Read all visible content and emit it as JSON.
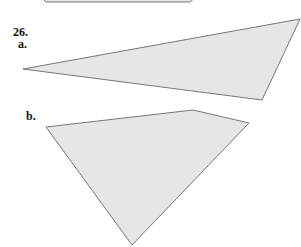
{
  "problem": {
    "number": "26.",
    "parts": [
      {
        "label": "a.",
        "shape": "triangle",
        "vertices": [
          [
            23,
            69
          ],
          [
            300,
            19
          ],
          [
            262,
            100
          ]
        ]
      },
      {
        "label": "b.",
        "shape": "quadrilateral",
        "vertices": [
          [
            46,
            127
          ],
          [
            193,
            110
          ],
          [
            249,
            123
          ],
          [
            132,
            245
          ]
        ]
      }
    ]
  },
  "previous_shape_edge": {
    "from": [
      45,
      2
    ],
    "to": [
      195,
      2
    ]
  },
  "colors": {
    "fill": "#e6e6e6",
    "stroke": "#777777",
    "text": "#111111"
  }
}
